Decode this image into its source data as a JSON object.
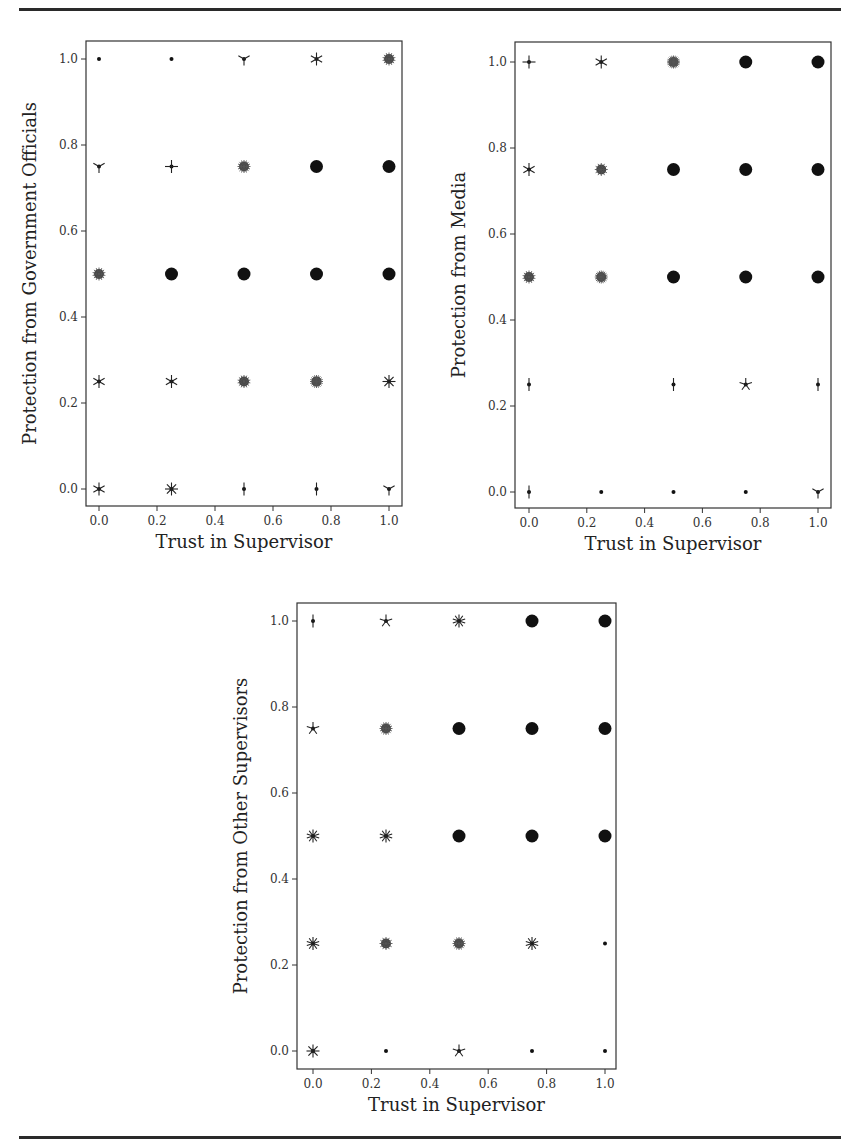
{
  "page": {
    "top_rule": true,
    "bottom_rule": true
  },
  "chart_data": [
    {
      "type": "scatter",
      "subtype": "sunflower",
      "title": "",
      "xlabel": "Trust in Supervisor",
      "ylabel": "Protection from Government Officials",
      "xlim": [
        -0.03,
        1.03
      ],
      "ylim": [
        -0.04,
        1.04
      ],
      "xticks": [
        "0.0",
        "0.2",
        "0.4",
        "0.6",
        "0.8",
        "1.0"
      ],
      "yticks": [
        "0.0",
        "0.2",
        "0.4",
        "0.6",
        "0.8",
        "1.0"
      ],
      "grid": false,
      "frame": {
        "left": 86,
        "top": 41,
        "right": 402,
        "bottom": 506,
        "x0": 99,
        "x1": 389,
        "y0": 489,
        "y1": 59
      },
      "points": [
        {
          "x": 0.0,
          "y": 1.0,
          "petals": 0
        },
        {
          "x": 0.25,
          "y": 1.0,
          "petals": 0
        },
        {
          "x": 0.5,
          "y": 1.0,
          "petals": 3
        },
        {
          "x": 0.75,
          "y": 1.0,
          "petals": 6
        },
        {
          "x": 1.0,
          "y": 1.0,
          "petals": 14
        },
        {
          "x": 0.0,
          "y": 0.75,
          "petals": 3
        },
        {
          "x": 0.25,
          "y": 0.75,
          "petals": 4
        },
        {
          "x": 0.5,
          "y": 0.75,
          "petals": 16
        },
        {
          "x": 0.75,
          "y": 0.75,
          "petals": 30
        },
        {
          "x": 1.0,
          "y": 0.75,
          "petals": 30
        },
        {
          "x": 0.0,
          "y": 0.5,
          "petals": 14
        },
        {
          "x": 0.25,
          "y": 0.5,
          "petals": 24
        },
        {
          "x": 0.5,
          "y": 0.5,
          "petals": 30
        },
        {
          "x": 0.75,
          "y": 0.5,
          "petals": 30
        },
        {
          "x": 1.0,
          "y": 0.5,
          "petals": 30
        },
        {
          "x": 0.0,
          "y": 0.25,
          "petals": 6
        },
        {
          "x": 0.25,
          "y": 0.25,
          "petals": 6
        },
        {
          "x": 0.5,
          "y": 0.25,
          "petals": 14
        },
        {
          "x": 0.75,
          "y": 0.25,
          "petals": 20
        },
        {
          "x": 1.0,
          "y": 0.25,
          "petals": 8
        },
        {
          "x": 0.0,
          "y": 0.0,
          "petals": 6
        },
        {
          "x": 0.25,
          "y": 0.0,
          "petals": 8
        },
        {
          "x": 0.5,
          "y": 0.0,
          "petals": 2
        },
        {
          "x": 0.75,
          "y": 0.0,
          "petals": 2
        },
        {
          "x": 1.0,
          "y": 0.0,
          "petals": 3
        }
      ]
    },
    {
      "type": "scatter",
      "subtype": "sunflower",
      "title": "",
      "xlabel": "Trust in Supervisor",
      "ylabel": "Protection from Media",
      "xlim": [
        -0.03,
        1.03
      ],
      "ylim": [
        -0.04,
        1.04
      ],
      "xticks": [
        "0.0",
        "0.2",
        "0.4",
        "0.6",
        "0.8",
        "1.0"
      ],
      "yticks": [
        "0.0",
        "0.2",
        "0.4",
        "0.6",
        "0.8",
        "1.0"
      ],
      "grid": false,
      "frame": {
        "left": 515,
        "top": 42,
        "right": 831,
        "bottom": 508,
        "x0": 529,
        "x1": 818,
        "y0": 492,
        "y1": 62
      },
      "points": [
        {
          "x": 0.0,
          "y": 1.0,
          "petals": 4
        },
        {
          "x": 0.25,
          "y": 1.0,
          "petals": 6
        },
        {
          "x": 0.5,
          "y": 1.0,
          "petals": 22
        },
        {
          "x": 0.75,
          "y": 1.0,
          "petals": 30
        },
        {
          "x": 1.0,
          "y": 1.0,
          "petals": 30
        },
        {
          "x": 0.0,
          "y": 0.75,
          "petals": 6
        },
        {
          "x": 0.25,
          "y": 0.75,
          "petals": 12
        },
        {
          "x": 0.5,
          "y": 0.75,
          "petals": 30
        },
        {
          "x": 0.75,
          "y": 0.75,
          "petals": 30
        },
        {
          "x": 1.0,
          "y": 0.75,
          "petals": 30
        },
        {
          "x": 0.0,
          "y": 0.5,
          "petals": 14
        },
        {
          "x": 0.25,
          "y": 0.5,
          "petals": 20
        },
        {
          "x": 0.5,
          "y": 0.5,
          "petals": 30
        },
        {
          "x": 0.75,
          "y": 0.5,
          "petals": 30
        },
        {
          "x": 1.0,
          "y": 0.5,
          "petals": 30
        },
        {
          "x": 0.0,
          "y": 0.25,
          "petals": 2
        },
        {
          "x": 0.5,
          "y": 0.25,
          "petals": 2
        },
        {
          "x": 0.75,
          "y": 0.25,
          "petals": 5
        },
        {
          "x": 1.0,
          "y": 0.25,
          "petals": 2
        },
        {
          "x": 0.0,
          "y": 0.0,
          "petals": 2
        },
        {
          "x": 0.25,
          "y": 0.0,
          "petals": 0
        },
        {
          "x": 0.5,
          "y": 0.0,
          "petals": 0
        },
        {
          "x": 0.75,
          "y": 0.0,
          "petals": 0
        },
        {
          "x": 1.0,
          "y": 0.0,
          "petals": 3
        }
      ]
    },
    {
      "type": "scatter",
      "subtype": "sunflower",
      "title": "",
      "xlabel": "Trust in Supervisor",
      "ylabel": "Protection from Other Supervisors",
      "xlim": [
        -0.03,
        1.03
      ],
      "ylim": [
        -0.04,
        1.04
      ],
      "xticks": [
        "0.0",
        "0.2",
        "0.4",
        "0.6",
        "0.8",
        "1.0"
      ],
      "yticks": [
        "0.0",
        "0.2",
        "0.4",
        "0.6",
        "0.8",
        "1.0"
      ],
      "grid": false,
      "frame": {
        "left": 297,
        "top": 603,
        "right": 616,
        "bottom": 1069,
        "x0": 313,
        "x1": 605,
        "y0": 1051,
        "y1": 621
      },
      "points": [
        {
          "x": 0.0,
          "y": 1.0,
          "petals": 2
        },
        {
          "x": 0.25,
          "y": 1.0,
          "petals": 5
        },
        {
          "x": 0.5,
          "y": 1.0,
          "petals": 10
        },
        {
          "x": 0.75,
          "y": 1.0,
          "petals": 30
        },
        {
          "x": 1.0,
          "y": 1.0,
          "petals": 30
        },
        {
          "x": 0.0,
          "y": 0.75,
          "petals": 5
        },
        {
          "x": 0.25,
          "y": 0.75,
          "petals": 16
        },
        {
          "x": 0.5,
          "y": 0.75,
          "petals": 30
        },
        {
          "x": 0.75,
          "y": 0.75,
          "petals": 30
        },
        {
          "x": 1.0,
          "y": 0.75,
          "petals": 30
        },
        {
          "x": 0.0,
          "y": 0.5,
          "petals": 10
        },
        {
          "x": 0.25,
          "y": 0.5,
          "petals": 10
        },
        {
          "x": 0.5,
          "y": 0.5,
          "petals": 30
        },
        {
          "x": 0.75,
          "y": 0.5,
          "petals": 30
        },
        {
          "x": 1.0,
          "y": 0.5,
          "petals": 30
        },
        {
          "x": 0.0,
          "y": 0.25,
          "petals": 10
        },
        {
          "x": 0.25,
          "y": 0.25,
          "petals": 12
        },
        {
          "x": 0.5,
          "y": 0.25,
          "petals": 16
        },
        {
          "x": 0.75,
          "y": 0.25,
          "petals": 10
        },
        {
          "x": 1.0,
          "y": 0.25,
          "petals": 0
        },
        {
          "x": 0.0,
          "y": 0.0,
          "petals": 8
        },
        {
          "x": 0.25,
          "y": 0.0,
          "petals": 0
        },
        {
          "x": 0.5,
          "y": 0.0,
          "petals": 5
        },
        {
          "x": 0.75,
          "y": 0.0,
          "petals": 0
        },
        {
          "x": 1.0,
          "y": 0.0,
          "petals": 0
        }
      ]
    }
  ]
}
